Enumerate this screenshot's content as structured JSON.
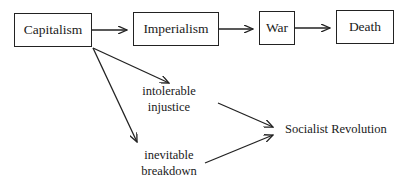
{
  "diagram": {
    "nodes": {
      "capitalism": "Capitalism",
      "imperialism": "Imperialism",
      "war": "War",
      "death": "Death",
      "intolerable_injustice": {
        "line1": "intolerable",
        "line2": "injustice"
      },
      "inevitable_breakdown": {
        "line1": "inevitable",
        "line2": "breakdown"
      },
      "socialist_revolution": "Socialist Revolution"
    },
    "edges": [
      {
        "from": "Capitalism",
        "to": "Imperialism"
      },
      {
        "from": "Imperialism",
        "to": "War"
      },
      {
        "from": "War",
        "to": "Death"
      },
      {
        "from": "Capitalism",
        "to": "intolerable injustice"
      },
      {
        "from": "Capitalism",
        "to": "inevitable breakdown"
      },
      {
        "from": "intolerable injustice",
        "to": "Socialist Revolution"
      },
      {
        "from": "inevitable breakdown",
        "to": "Socialist Revolution"
      }
    ]
  }
}
